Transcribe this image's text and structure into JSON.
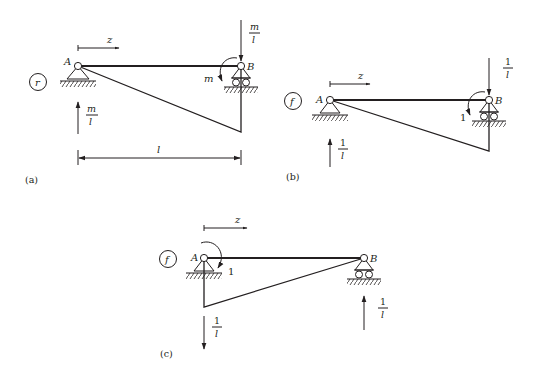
{
  "figure": {
    "panels": [
      {
        "id": "a",
        "caption": "(a)",
        "tag": "r",
        "axis_label": "z",
        "node_a_label": "A",
        "node_b_label": "B",
        "moment_label": "m",
        "reaction_a": {
          "num": "m",
          "den": "l",
          "direction": "up"
        },
        "reaction_b": {
          "num": "m",
          "den": "l",
          "direction": "down"
        },
        "span_label": "l",
        "diagram_shape": "triangle, zero at A, max at B (below beam)"
      },
      {
        "id": "b",
        "caption": "(b)",
        "tag": "f",
        "axis_label": "z",
        "node_a_label": "A",
        "node_b_label": "B",
        "moment_label": "1",
        "reaction_a": {
          "num": "1",
          "den": "l",
          "direction": "up"
        },
        "reaction_b": {
          "num": "1",
          "den": "l",
          "direction": "down"
        },
        "diagram_shape": "triangle, zero at A, max at B (below beam)"
      },
      {
        "id": "c",
        "caption": "(c)",
        "tag": "f",
        "axis_label": "z",
        "node_a_label": "A",
        "node_b_label": "B",
        "moment_label": "1",
        "reaction_a": {
          "num": "1",
          "den": "l",
          "direction": "down"
        },
        "reaction_b": {
          "num": "1",
          "den": "l",
          "direction": "up"
        },
        "diagram_shape": "triangle, max at A, zero at B (below beam)"
      }
    ],
    "colors": {
      "ink": "#231f20",
      "background": "#ffffff"
    }
  }
}
